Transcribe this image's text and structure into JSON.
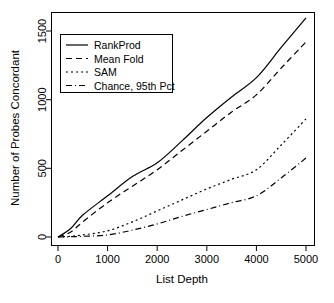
{
  "chart_data": {
    "type": "line",
    "title": "",
    "xlabel": "List Depth",
    "ylabel": "Number of Probes Concordant",
    "xlim": [
      0,
      5200
    ],
    "ylim": [
      -30,
      1650
    ],
    "xticks": [
      0,
      1000,
      2000,
      3000,
      4000,
      5000
    ],
    "xtick_labels": [
      "0",
      "1000",
      "2000",
      "3000",
      "4000",
      "5000"
    ],
    "yticks": [
      0,
      500,
      1000,
      1500
    ],
    "ytick_labels": [
      "0",
      "500",
      "1000",
      "1500"
    ],
    "grid": false,
    "legend_position": "top-left",
    "x": [
      0,
      250,
      500,
      1000,
      1500,
      2000,
      2500,
      3000,
      3500,
      4000,
      4500,
      5000
    ],
    "series": [
      {
        "name": "RankProd",
        "linestyle": "solid",
        "color": "#000000",
        "values": [
          0,
          60,
          160,
          300,
          440,
          540,
          700,
          870,
          1020,
          1160,
          1380,
          1595
        ]
      },
      {
        "name": "Mean Fold",
        "linestyle": "dashed",
        "color": "#000000",
        "values": [
          0,
          35,
          110,
          250,
          370,
          490,
          630,
          770,
          910,
          1035,
          1230,
          1420
        ]
      },
      {
        "name": "SAM",
        "linestyle": "dotted",
        "color": "#000000",
        "values": [
          0,
          5,
          15,
          45,
          110,
          190,
          270,
          350,
          420,
          490,
          670,
          860
        ]
      },
      {
        "name": "Chance, 95th Pct",
        "linestyle": "dashdot",
        "color": "#000000",
        "values": [
          0,
          2,
          5,
          15,
          50,
          95,
          150,
          200,
          250,
          300,
          430,
          575
        ]
      }
    ]
  },
  "legend": {
    "entries": [
      {
        "label": "RankProd"
      },
      {
        "label": "Mean Fold"
      },
      {
        "label": "SAM"
      },
      {
        "label": "Chance, 95th Pct"
      }
    ]
  }
}
